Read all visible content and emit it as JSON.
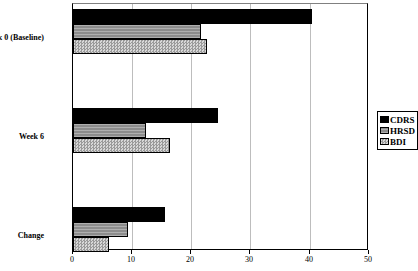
{
  "chart_data": {
    "type": "bar",
    "orientation": "horizontal",
    "title": "",
    "xlabel": "",
    "ylabel": "",
    "xlim": [
      0,
      50
    ],
    "xticks": [
      0,
      10,
      20,
      30,
      40,
      50
    ],
    "xtick_labels": [
      "0",
      "10",
      "20",
      "30",
      "40",
      "50"
    ],
    "grid": true,
    "grid_axis": "x",
    "legend_position": "right",
    "categories": [
      "Week 0 (Baseline)",
      "Week 6",
      "Change"
    ],
    "series": [
      {
        "name": "CDRS",
        "color": "#000000",
        "pattern": "solid-black",
        "values": [
          40.3,
          24.5,
          15.5
        ]
      },
      {
        "name": "HRSD",
        "color": "#8c8c8c",
        "pattern": "horizontal-hatch-gray",
        "values": [
          21.6,
          12.3,
          9.3
        ]
      },
      {
        "name": "BDI",
        "color": "#bfbfbf",
        "pattern": "checkered-light-gray",
        "values": [
          22.6,
          16.4,
          6.1
        ]
      }
    ]
  },
  "legend": {
    "items": [
      {
        "label": "CDRS"
      },
      {
        "label": "HRSD"
      },
      {
        "label": "BDI"
      }
    ]
  }
}
